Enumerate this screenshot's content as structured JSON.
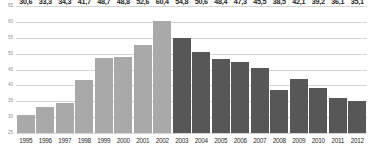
{
  "chart_data": {
    "type": "bar",
    "title": "",
    "subtitle": "",
    "xlabel": "",
    "ylabel": "",
    "ylim": [
      25,
      65
    ],
    "ytick_step": 5,
    "yticks": [
      "65",
      "60",
      "55",
      "50",
      "45",
      "40",
      "35",
      "30",
      "25"
    ],
    "grid": true,
    "legend": "none",
    "decimal_separator": ",",
    "categories": [
      "1995",
      "1996",
      "1997",
      "1998",
      "1999",
      "2000",
      "2001",
      "2002",
      "2003",
      "2004",
      "2005",
      "2006",
      "2007",
      "2008",
      "2009",
      "2010",
      "2011",
      "2012"
    ],
    "values": [
      30.6,
      33.3,
      34.3,
      41.7,
      48.7,
      48.8,
      52.6,
      60.4,
      54.8,
      50.6,
      48.4,
      47.3,
      45.5,
      38.5,
      42.1,
      39.2,
      36.1,
      35.1
    ],
    "value_labels": [
      "30,6",
      "33,3",
      "34,3",
      "41,7",
      "48,7",
      "48,8",
      "52,6",
      "60,4",
      "54,8",
      "50,6",
      "48,4",
      "47,3",
      "45,5",
      "38,5",
      "42,1",
      "39,2",
      "36,1",
      "35,1"
    ],
    "bar_colors": [
      "#a9a9a9",
      "#a9a9a9",
      "#a9a9a9",
      "#a9a9a9",
      "#a9a9a9",
      "#a9a9a9",
      "#a9a9a9",
      "#a9a9a9",
      "#575757",
      "#575757",
      "#575757",
      "#575757",
      "#575757",
      "#575757",
      "#575757",
      "#575757",
      "#575757",
      "#575757"
    ],
    "colors": {
      "series_light": "#a9a9a9",
      "series_dark": "#575757",
      "gridline": "#d5d5d5",
      "axis_text": "#8d8d8d",
      "label_text": "#1e1e1e",
      "background": "#ffffff"
    }
  }
}
